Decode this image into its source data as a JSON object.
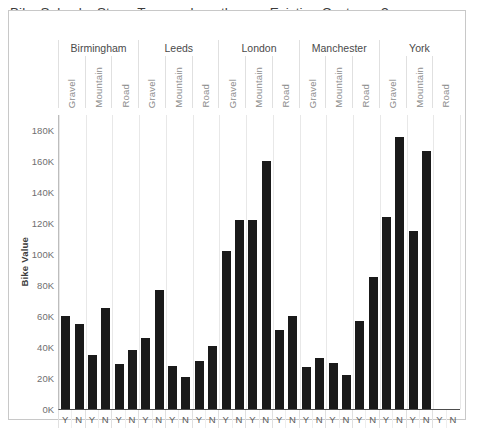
{
  "chart_title": "Bike Sales by Store, Type and are they an Existing Customer?",
  "axis": {
    "y_title": "Bike Value",
    "y_ticks": [
      "180K",
      "160K",
      "140K",
      "120K",
      "100K",
      "80K",
      "60K",
      "40K",
      "20K",
      "0K"
    ]
  },
  "chart_data": {
    "type": "bar",
    "title": "Bike Sales by Store, Type and are they an Existing Customer?",
    "xlabel": "",
    "ylabel": "Bike Value",
    "ylim": [
      0,
      190000
    ],
    "grid": true,
    "legend": "none",
    "bar_color": "#1a1a1a",
    "hierarchy": [
      "Store",
      "Type",
      "Existing Customer"
    ],
    "stores": [
      "Birmingham",
      "Leeds",
      "London",
      "Manchester",
      "York"
    ],
    "types": [
      "Gravel",
      "Mountain",
      "Road"
    ],
    "existing_customer": [
      "Y",
      "N"
    ],
    "groups": [
      {
        "store": "Birmingham",
        "types": [
          {
            "type": "Gravel",
            "values": [
              60000,
              55000
            ]
          },
          {
            "type": "Mountain",
            "values": [
              35000,
              65000
            ]
          },
          {
            "type": "Road",
            "values": [
              29000,
              38000
            ]
          }
        ]
      },
      {
        "store": "Leeds",
        "types": [
          {
            "type": "Gravel",
            "values": [
              46000,
              77000
            ]
          },
          {
            "type": "Mountain",
            "values": [
              28000,
              21000
            ]
          },
          {
            "type": "Road",
            "values": [
              31000,
              41000
            ]
          }
        ]
      },
      {
        "store": "London",
        "types": [
          {
            "type": "Gravel",
            "values": [
              102000,
              122000
            ]
          },
          {
            "type": "Mountain",
            "values": [
              122000,
              160000
            ]
          },
          {
            "type": "Road",
            "values": [
              51000,
              60000
            ]
          }
        ]
      },
      {
        "store": "Manchester",
        "types": [
          {
            "type": "Gravel",
            "values": [
              27000,
              33000
            ]
          },
          {
            "type": "Mountain",
            "values": [
              30000,
              22000
            ]
          },
          {
            "type": "Road",
            "values": [
              57000,
              85000
            ]
          }
        ]
      },
      {
        "store": "York",
        "types": [
          {
            "type": "Gravel",
            "values": [
              124000,
              176000
            ]
          },
          {
            "type": "Mountain",
            "values": [
              115000,
              167000
            ]
          },
          {
            "type": "Road",
            "values": [
              0,
              0
            ]
          }
        ]
      }
    ],
    "categories": [
      "Birmingham / Gravel / Y",
      "Birmingham / Gravel / N",
      "Birmingham / Mountain / Y",
      "Birmingham / Mountain / N",
      "Birmingham / Road / Y",
      "Birmingham / Road / N",
      "Leeds / Gravel / Y",
      "Leeds / Gravel / N",
      "Leeds / Mountain / Y",
      "Leeds / Mountain / N",
      "Leeds / Road / Y",
      "Leeds / Road / N",
      "London / Gravel / Y",
      "London / Gravel / N",
      "London / Mountain / Y",
      "London / Mountain / N",
      "London / Road / Y",
      "London / Road / N",
      "Manchester / Gravel / Y",
      "Manchester / Gravel / N",
      "Manchester / Mountain / Y",
      "Manchester / Mountain / N",
      "Manchester / Road / Y",
      "Manchester / Road / N",
      "York / Gravel / Y",
      "York / Gravel / N",
      "York / Mountain / Y",
      "York / Mountain / N",
      "York / Road / Y",
      "York / Road / N"
    ],
    "values": [
      60000,
      55000,
      35000,
      65000,
      29000,
      38000,
      46000,
      77000,
      28000,
      21000,
      31000,
      41000,
      102000,
      122000,
      122000,
      160000,
      51000,
      60000,
      27000,
      33000,
      30000,
      22000,
      57000,
      85000,
      124000,
      176000,
      115000,
      167000,
      0,
      0
    ]
  }
}
